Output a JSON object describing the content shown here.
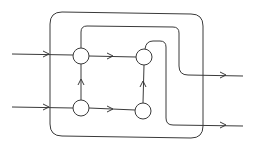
{
  "diagram": {
    "type": "flow-network",
    "stroke_color": "#3a3a3a",
    "background": "#ffffff",
    "boundary": {
      "label": "",
      "shape": "rounded-rectangle"
    },
    "nodes": [
      {
        "id": "n1",
        "position": "top-left",
        "label": ""
      },
      {
        "id": "n2",
        "position": "top-right",
        "label": ""
      },
      {
        "id": "n3",
        "position": "bottom-left",
        "label": ""
      },
      {
        "id": "n4",
        "position": "bottom-right",
        "label": ""
      }
    ],
    "edges": [
      {
        "from": "input-top",
        "to": "n1",
        "directed": true
      },
      {
        "from": "input-bottom",
        "to": "n3",
        "directed": true
      },
      {
        "from": "n1",
        "to": "n2",
        "directed": true
      },
      {
        "from": "n3",
        "to": "n4",
        "directed": true
      },
      {
        "from": "n3",
        "to": "n1",
        "directed": true
      },
      {
        "from": "n4",
        "to": "n2",
        "directed": true
      },
      {
        "from": "n1",
        "to": "output-top",
        "directed": true
      },
      {
        "from": "n2",
        "to": "output-bottom",
        "directed": true
      }
    ],
    "inputs": 2,
    "outputs": 2
  }
}
